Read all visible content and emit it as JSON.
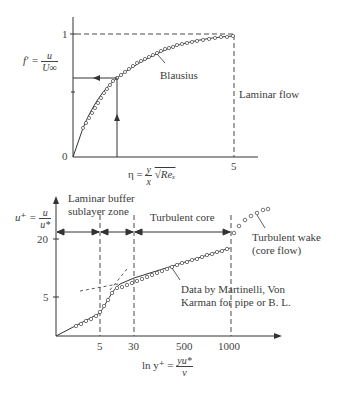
{
  "top_chart": {
    "title": "Laminar boundary layer velocity profile",
    "y_axis_label_lhs": "f' =",
    "y_axis_label_num": "u",
    "y_axis_label_den": "U∞",
    "y_ticks": [
      "1",
      "0"
    ],
    "x_axis_label_lhs": "η =",
    "x_axis_label_num": "y",
    "x_axis_label_den": "x",
    "x_axis_label_root": "√Reₓ",
    "x_ticks": [
      "5"
    ],
    "curve_label": "Blausius",
    "region_label": "Laminar flow"
  },
  "bottom_chart": {
    "y_axis_label_lhs": "u⁺ =",
    "y_axis_label_num": "u",
    "y_axis_label_den": "u*",
    "y_ticks": [
      "20",
      "5"
    ],
    "x_axis_label_lhs": "ln  y⁺ =",
    "x_axis_label_num": "yu*",
    "x_axis_label_den": "ν",
    "x_ticks": [
      "5",
      "30",
      "500",
      "1000"
    ],
    "zone_labels": {
      "laminar_line1": "Laminar buffer",
      "laminar_line2": "sublayer zone",
      "turbulent_core": "Turbulent core",
      "wake_line1": "Turbulent wake",
      "wake_line2": "(core flow)",
      "data_line1": "Data by Martinelli, Von",
      "data_line2": "Karman for pipe or B. L."
    }
  },
  "colors": {
    "line": "#333333",
    "marker": "#555555",
    "background": "#ffffff"
  }
}
